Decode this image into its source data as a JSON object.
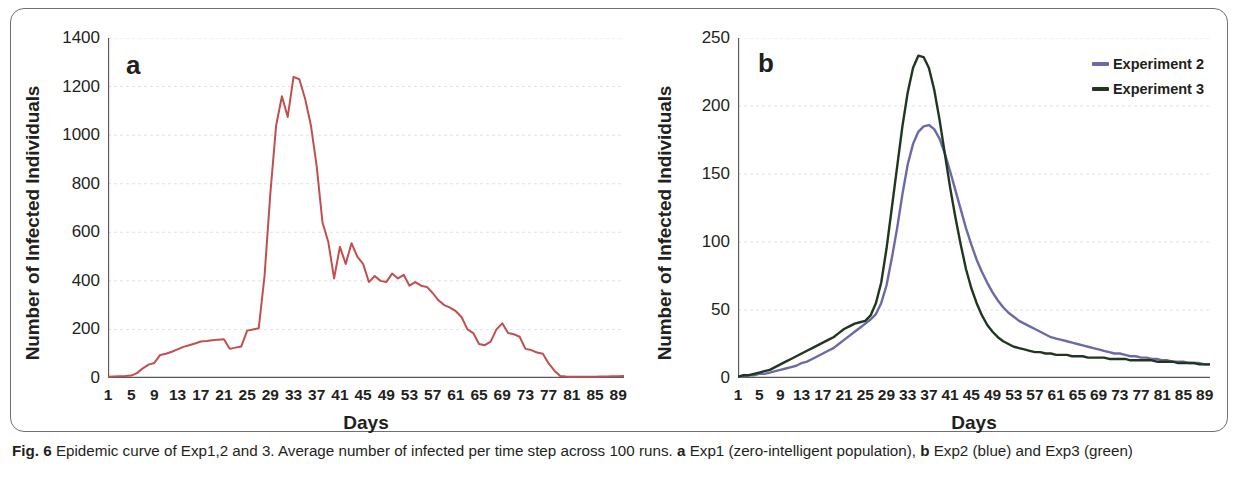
{
  "figure": {
    "caption_label": "Fig. 6",
    "caption_text_1": "Epidemic curve of Exp1,2 and 3. Average number of infected per time step across 100 runs.",
    "caption_a_marker": "a",
    "caption_a_text": "Exp1 (zero-intelligent population),",
    "caption_b_marker": "b",
    "caption_b_text": "Exp2 (blue) and Exp3 (green)"
  },
  "colors": {
    "red": "#c0504d",
    "blue": "#6a6aa8",
    "green": "#20361f",
    "grid": "#e2e2e6",
    "axis": "#595959",
    "frame": "#6f6f6f"
  },
  "chart_data": [
    {
      "type": "line",
      "panel": "a",
      "title": "",
      "xlabel": "Days",
      "ylabel": "Number of Infected Individuals",
      "xlim": [
        1,
        90
      ],
      "ylim": [
        0,
        1400
      ],
      "ytick_labels": [
        "0",
        "200",
        "400",
        "600",
        "800",
        "1000",
        "1200",
        "1400"
      ],
      "ytick_values": [
        0,
        200,
        400,
        600,
        800,
        1000,
        1200,
        1400
      ],
      "xtick_labels": [
        "1",
        "5",
        "9",
        "13",
        "17",
        "21",
        "25",
        "29",
        "33",
        "37",
        "41",
        "45",
        "49",
        "53",
        "57",
        "61",
        "65",
        "69",
        "73",
        "77",
        "81",
        "85",
        "89"
      ],
      "xtick_values": [
        1,
        5,
        9,
        13,
        17,
        21,
        25,
        29,
        33,
        37,
        41,
        45,
        49,
        53,
        57,
        61,
        65,
        69,
        73,
        77,
        81,
        85,
        89
      ],
      "grid": "horizontal-dotted",
      "legend": "none",
      "series": [
        {
          "name": "Experiment 1",
          "color": "#c0504d",
          "x": [
            1,
            2,
            3,
            4,
            5,
            6,
            7,
            8,
            9,
            10,
            11,
            12,
            13,
            14,
            15,
            16,
            17,
            18,
            19,
            20,
            21,
            22,
            23,
            24,
            25,
            26,
            27,
            28,
            29,
            30,
            31,
            32,
            33,
            34,
            35,
            36,
            37,
            38,
            39,
            40,
            41,
            42,
            43,
            44,
            45,
            46,
            47,
            48,
            49,
            50,
            51,
            52,
            53,
            54,
            55,
            56,
            57,
            58,
            59,
            60,
            61,
            62,
            63,
            64,
            65,
            66,
            67,
            68,
            69,
            70,
            71,
            72,
            73,
            74,
            75,
            76,
            77,
            78,
            79,
            80,
            81,
            82,
            83,
            84,
            85,
            86,
            87,
            88,
            89,
            90
          ],
          "values": [
            5,
            6,
            7,
            8,
            10,
            20,
            40,
            55,
            62,
            95,
            100,
            108,
            118,
            128,
            135,
            142,
            150,
            152,
            155,
            158,
            160,
            120,
            125,
            130,
            195,
            200,
            205,
            420,
            760,
            1040,
            1160,
            1075,
            1240,
            1230,
            1150,
            1040,
            870,
            640,
            560,
            410,
            540,
            470,
            555,
            500,
            470,
            395,
            420,
            400,
            395,
            430,
            410,
            425,
            380,
            395,
            380,
            375,
            350,
            320,
            300,
            290,
            275,
            250,
            200,
            185,
            140,
            135,
            150,
            200,
            225,
            185,
            180,
            170,
            120,
            115,
            105,
            100,
            60,
            30,
            8,
            6,
            5,
            5,
            5,
            5,
            5,
            6,
            6,
            7,
            7,
            8
          ]
        }
      ]
    },
    {
      "type": "line",
      "panel": "b",
      "title": "",
      "xlabel": "Days",
      "ylabel": "Number of Infected Individuals",
      "xlim": [
        1,
        90
      ],
      "ylim": [
        0,
        250
      ],
      "ytick_labels": [
        "0",
        "50",
        "100",
        "150",
        "200",
        "250"
      ],
      "ytick_values": [
        0,
        50,
        100,
        150,
        200,
        250
      ],
      "xtick_labels": [
        "1",
        "5",
        "9",
        "13",
        "17",
        "21",
        "25",
        "29",
        "33",
        "37",
        "41",
        "45",
        "49",
        "53",
        "57",
        "61",
        "65",
        "69",
        "73",
        "77",
        "81",
        "85",
        "89"
      ],
      "xtick_values": [
        1,
        5,
        9,
        13,
        17,
        21,
        25,
        29,
        33,
        37,
        41,
        45,
        49,
        53,
        57,
        61,
        65,
        69,
        73,
        77,
        81,
        85,
        89
      ],
      "grid": "horizontal-dotted",
      "legend": "top-right",
      "series": [
        {
          "name": "Experiment 2",
          "color": "#6a6aa8",
          "x": [
            1,
            2,
            3,
            4,
            5,
            6,
            7,
            8,
            9,
            10,
            11,
            12,
            13,
            14,
            15,
            16,
            17,
            18,
            19,
            20,
            21,
            22,
            23,
            24,
            25,
            26,
            27,
            28,
            29,
            30,
            31,
            32,
            33,
            34,
            35,
            36,
            37,
            38,
            39,
            40,
            41,
            42,
            43,
            44,
            45,
            46,
            47,
            48,
            49,
            50,
            51,
            52,
            53,
            54,
            55,
            56,
            57,
            58,
            59,
            60,
            61,
            62,
            63,
            64,
            65,
            66,
            67,
            68,
            69,
            70,
            71,
            72,
            73,
            74,
            75,
            76,
            77,
            78,
            79,
            80,
            81,
            82,
            83,
            84,
            85,
            86,
            87,
            88,
            89,
            90
          ],
          "values": [
            1,
            1,
            2,
            2,
            3,
            3,
            4,
            5,
            6,
            7,
            8,
            9,
            11,
            12,
            14,
            16,
            18,
            20,
            22,
            25,
            28,
            31,
            34,
            37,
            40,
            43,
            47,
            55,
            68,
            88,
            110,
            135,
            157,
            172,
            181,
            185,
            186,
            183,
            176,
            165,
            152,
            138,
            124,
            110,
            98,
            87,
            78,
            70,
            63,
            57,
            52,
            48,
            45,
            42,
            40,
            38,
            36,
            34,
            32,
            30,
            29,
            28,
            27,
            26,
            25,
            24,
            23,
            22,
            21,
            20,
            19,
            18,
            18,
            17,
            16,
            16,
            15,
            15,
            14,
            14,
            13,
            13,
            12,
            12,
            12,
            11,
            11,
            11,
            10,
            10
          ]
        },
        {
          "name": "Experiment 3",
          "color": "#20361f",
          "x": [
            1,
            2,
            3,
            4,
            5,
            6,
            7,
            8,
            9,
            10,
            11,
            12,
            13,
            14,
            15,
            16,
            17,
            18,
            19,
            20,
            21,
            22,
            23,
            24,
            25,
            26,
            27,
            28,
            29,
            30,
            31,
            32,
            33,
            34,
            35,
            36,
            37,
            38,
            39,
            40,
            41,
            42,
            43,
            44,
            45,
            46,
            47,
            48,
            49,
            50,
            51,
            52,
            53,
            54,
            55,
            56,
            57,
            58,
            59,
            60,
            61,
            62,
            63,
            64,
            65,
            66,
            67,
            68,
            69,
            70,
            71,
            72,
            73,
            74,
            75,
            76,
            77,
            78,
            79,
            80,
            81,
            82,
            83,
            84,
            85,
            86,
            87,
            88,
            89,
            90
          ],
          "values": [
            1,
            2,
            2,
            3,
            4,
            5,
            6,
            8,
            10,
            12,
            14,
            16,
            18,
            20,
            22,
            24,
            26,
            28,
            30,
            33,
            36,
            38,
            40,
            41,
            42,
            46,
            55,
            70,
            95,
            125,
            155,
            185,
            210,
            228,
            237,
            236,
            228,
            212,
            190,
            165,
            140,
            118,
            98,
            80,
            66,
            55,
            46,
            39,
            34,
            30,
            27,
            25,
            23,
            22,
            21,
            20,
            19,
            19,
            18,
            18,
            17,
            17,
            17,
            16,
            16,
            16,
            15,
            15,
            15,
            15,
            14,
            14,
            14,
            14,
            13,
            13,
            13,
            13,
            13,
            12,
            12,
            12,
            12,
            11,
            11,
            11,
            11,
            10,
            10,
            10
          ]
        }
      ]
    }
  ]
}
